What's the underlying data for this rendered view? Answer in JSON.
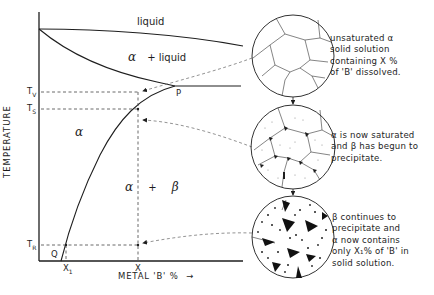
{
  "diagram": {
    "type": "phase-diagram",
    "axes": {
      "y_title": "TEMPERATURE",
      "x_title": "METAL 'B' %",
      "x_arrow": "→"
    },
    "regions": {
      "liquid": "liquid",
      "alpha_liquid_alpha": "α",
      "alpha_liquid_plus": "+ liquid",
      "alpha": "α",
      "alpha_beta_alpha": "α",
      "alpha_beta_plus": "+",
      "alpha_beta_beta": "β"
    },
    "points": {
      "P": "P",
      "Q": "Q"
    },
    "y_ticks": {
      "TV": {
        "main": "T",
        "sub": "V"
      },
      "TS": {
        "main": "T",
        "sub": "S"
      },
      "TR": {
        "main": "T",
        "sub": "R"
      }
    },
    "x_ticks": {
      "X1": {
        "main": "X",
        "sub": "1"
      },
      "X": {
        "main": "X",
        "sub": ""
      }
    },
    "microstructures": [
      {
        "id": "unsaturated",
        "lines": [
          "unsaturated α",
          "solid solution",
          "containing X %",
          "of 'B' dissolved."
        ]
      },
      {
        "id": "saturated",
        "lines": [
          "α is now saturated",
          "and β has begun to",
          "precipitate."
        ]
      },
      {
        "id": "precipitating",
        "lines": [
          "β continues to",
          "precipitate and",
          "α now contains",
          "only X₁% of 'B' in",
          "solid solution."
        ]
      }
    ],
    "colors": {
      "ink": "#1e1e1e",
      "dashed": "#555555",
      "background": "#ffffff"
    }
  }
}
